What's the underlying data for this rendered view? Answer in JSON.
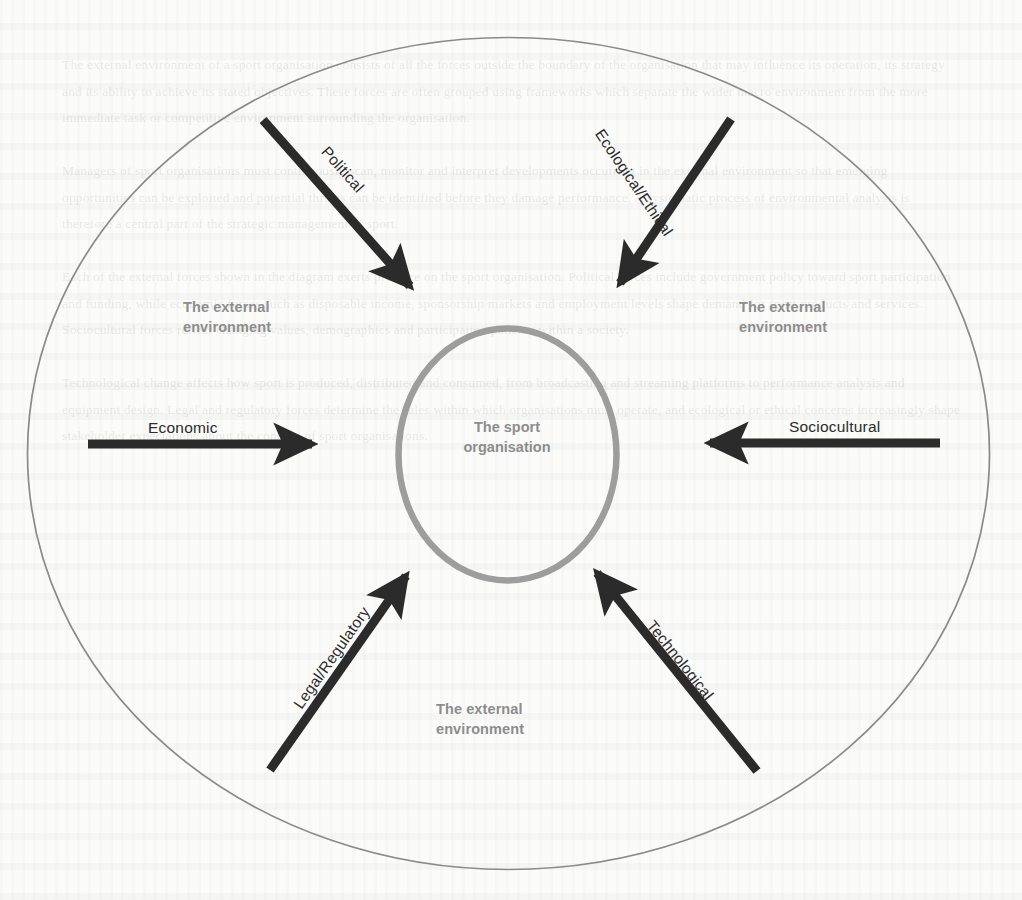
{
  "diagram": {
    "title": "The external environment of a sport organisation",
    "type": "concentric-circle-influence-diagram",
    "colors": {
      "outer_circle_stroke": "#8a8a8a",
      "inner_circle_stroke": "#9a9a9a",
      "arrow": "#2b2b2b",
      "label_gray": "#8d8d8d",
      "arrow_label": "#2b2b2b",
      "background": "#fbfbf9"
    },
    "center": {
      "line1": "The sport",
      "line2": "organisation"
    },
    "environment_labels": [
      {
        "id": "top-left",
        "line1": "The external",
        "line2": "environment"
      },
      {
        "id": "top-right",
        "line1": "The external",
        "line2": "environment"
      },
      {
        "id": "bottom-center",
        "line1": "The external",
        "line2": "environment"
      }
    ],
    "forces": [
      {
        "id": "political",
        "label": "Political",
        "position": "top-left",
        "direction": "inward-down-right"
      },
      {
        "id": "ecological-ethical",
        "label": "Ecological/Ethical",
        "position": "top-right",
        "direction": "inward-down-left"
      },
      {
        "id": "economic",
        "label": "Economic",
        "position": "left",
        "direction": "inward-right"
      },
      {
        "id": "sociocultural",
        "label": "Sociocultural",
        "position": "right",
        "direction": "inward-left"
      },
      {
        "id": "legal-regulatory",
        "label": "Legal/Regulatory",
        "position": "bottom-left",
        "direction": "inward-up-right"
      },
      {
        "id": "technological",
        "label": "Technological",
        "position": "bottom-right",
        "direction": "inward-up-left"
      }
    ]
  },
  "page_background": {
    "show_through_text": "The external environment of a sport organisation consists of all the forces outside the boundary of the organisation that may influence its operation, its strategy and its ability to achieve its stated objectives. These forces are often grouped using frameworks which separate the wider macro environment from the more immediate task or competitive environment surrounding the organisation.\n\nManagers of sport organisations must continuously scan, monitor and interpret developments occurring in the external environment so that emerging opportunities can be exploited and potential threats can be identified before they damage performance. A systematic process of environmental analysis is therefore a central part of the strategic management of sport.\n\nEach of the external forces shown in the diagram exerts pressure on the sport organisation. Political forces include government policy toward sport participation and funding, while economic forces such as disposable income, sponsorship markets and employment levels shape demand for sport products and services. Sociocultural forces reflect changing values, demographics and participation patterns within a society.\n\nTechnological change affects how sport is produced, distributed and consumed, from broadcasting and streaming platforms to performance analysis and equipment design. Legal and regulatory forces determine the rules within which organisations must operate, and ecological or ethical concerns increasingly shape stakeholder expectations about the conduct of sport organisations."
  }
}
